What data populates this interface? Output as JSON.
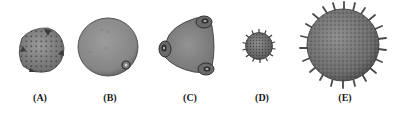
{
  "figure": {
    "background": "#ffffff",
    "panels": [
      {
        "id": "A",
        "label": "(A)",
        "type": "reticulate-polygonal",
        "label_x": 40
      },
      {
        "id": "B",
        "label": "(B)",
        "type": "smooth-monoporate",
        "label_x": 110
      },
      {
        "id": "C",
        "label": "(C)",
        "type": "triporate-triangular",
        "label_x": 190
      },
      {
        "id": "D",
        "label": "(D)",
        "type": "small-echinate",
        "label_x": 262
      },
      {
        "id": "E",
        "label": "(E)",
        "type": "large-echinate",
        "label_x": 345
      }
    ],
    "colors": {
      "grain_fill": "#8a8a8a",
      "grain_dark": "#4a4a4a",
      "grain_light": "#a8a8a8",
      "outline": "#3a3a3a",
      "label": "#1a1a1a"
    }
  }
}
